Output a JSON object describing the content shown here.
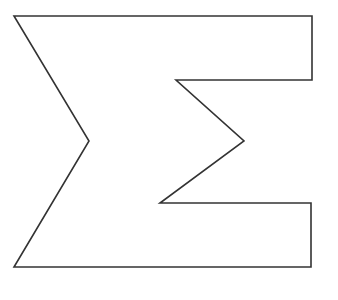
{
  "figure": {
    "shape": "sigma-symbol",
    "fill": "#ffffff",
    "stroke": "#333333",
    "stroke_width": 1.6,
    "points": [
      [
        14,
        16
      ],
      [
        312,
        16
      ],
      [
        312,
        80
      ],
      [
        176,
        80
      ],
      [
        244,
        141
      ],
      [
        160,
        203
      ],
      [
        311,
        203
      ],
      [
        311,
        267
      ],
      [
        14,
        267
      ],
      [
        89,
        141
      ]
    ]
  }
}
